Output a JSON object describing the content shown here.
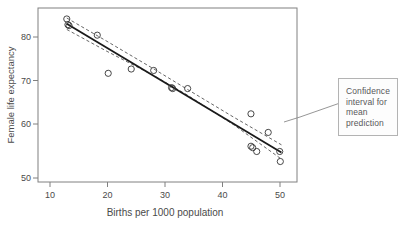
{
  "chart_data": {
    "type": "scatter",
    "title": "",
    "xlabel": "Births per 1000 population",
    "ylabel": "Female life expectancy",
    "xlim": [
      8,
      53
    ],
    "ylim": [
      48,
      84.5
    ],
    "xticks": [
      10,
      20,
      30,
      40,
      50
    ],
    "yticks": [
      50,
      60,
      70,
      80
    ],
    "grid": false,
    "legend": null,
    "points": [
      {
        "x": 13.0,
        "y": 82.2
      },
      {
        "x": 13.2,
        "y": 81.0
      },
      {
        "x": 13.4,
        "y": 80.8
      },
      {
        "x": 18.3,
        "y": 78.8
      },
      {
        "x": 20.2,
        "y": 70.8
      },
      {
        "x": 24.2,
        "y": 71.7
      },
      {
        "x": 28.1,
        "y": 71.4
      },
      {
        "x": 31.2,
        "y": 67.8
      },
      {
        "x": 31.4,
        "y": 67.6
      },
      {
        "x": 34.0,
        "y": 67.6
      },
      {
        "x": 45.0,
        "y": 62.3
      },
      {
        "x": 45.0,
        "y": 55.5
      },
      {
        "x": 45.3,
        "y": 55.2
      },
      {
        "x": 46.0,
        "y": 54.4
      },
      {
        "x": 48.0,
        "y": 58.4
      },
      {
        "x": 50.0,
        "y": 54.4
      },
      {
        "x": 50.1,
        "y": 52.3
      }
    ],
    "regression_line": {
      "label": "fitted regression line",
      "x1": 13.0,
      "y1": 81.2,
      "x2": 50.3,
      "y2": 54.2
    },
    "confidence_band": {
      "label": "Confidence interval for mean prediction",
      "style": "dashed",
      "upper": [
        {
          "x": 13.0,
          "y": 82.4
        },
        {
          "x": 20.0,
          "y": 77.5
        },
        {
          "x": 28.0,
          "y": 71.8
        },
        {
          "x": 34.0,
          "y": 67.4
        },
        {
          "x": 42.0,
          "y": 61.6
        },
        {
          "x": 50.3,
          "y": 55.8
        }
      ],
      "lower": [
        {
          "x": 13.0,
          "y": 80.0
        },
        {
          "x": 20.0,
          "y": 75.4
        },
        {
          "x": 28.0,
          "y": 70.4
        },
        {
          "x": 34.0,
          "y": 66.2
        },
        {
          "x": 42.0,
          "y": 60.0
        },
        {
          "x": 50.3,
          "y": 52.8
        }
      ]
    },
    "annotation": {
      "text": "Confidence interval for mean prediction",
      "leader_from": {
        "x": 50.0,
        "y": 59.5
      }
    }
  },
  "annotation_box": {
    "line1": "Confidence",
    "line2": "interval for",
    "line3": "mean",
    "line4": "prediction"
  },
  "axes": {
    "x_label": "Births per 1000 population",
    "y_label": "Female life expectancy",
    "x_tick_0": "10",
    "x_tick_1": "20",
    "x_tick_2": "30",
    "x_tick_3": "40",
    "x_tick_4": "50",
    "y_tick_0": "50",
    "y_tick_1": "60",
    "y_tick_2": "70",
    "y_tick_3": "80"
  },
  "colors": {
    "frame": "#808080",
    "marker": "#333333",
    "regression": "#1a1a1a",
    "band": "#555555",
    "box_border": "#b3b3b3",
    "text": "#4a4a4a"
  }
}
